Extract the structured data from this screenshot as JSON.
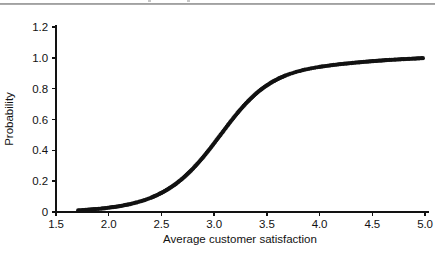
{
  "figure": {
    "background_color": "#ffffff",
    "ink_color": "#121212",
    "rule_color": "#8e8e8e"
  },
  "chart_data": {
    "type": "scatter",
    "title": "",
    "xlabel": "Average customer satisfaction",
    "ylabel": "Probability",
    "xlim": [
      1.5,
      5.0
    ],
    "ylim": [
      0.0,
      1.2
    ],
    "xticks": [
      "1.5",
      "2.0",
      "2.5",
      "3.0",
      "3.5",
      "4.0",
      "4.5",
      "5.0"
    ],
    "xtick_values": [
      1.5,
      2.0,
      2.5,
      3.0,
      3.5,
      4.0,
      4.5,
      5.0
    ],
    "yticks": [
      "0",
      "0.2",
      "0.4",
      "0.6",
      "0.8",
      "1.0",
      "1.2"
    ],
    "ytick_values": [
      0,
      0.2,
      0.4,
      0.6,
      0.8,
      1.0,
      1.2
    ],
    "grid": false,
    "legend": false,
    "marker": "filled-circle",
    "marker_color": "#121212",
    "marker_size_px": 4.2,
    "series": [
      {
        "name": "Predicted probability",
        "x": [
          1.71,
          1.86,
          1.93,
          1.97,
          1.99,
          2.02,
          2.06,
          2.09,
          2.12,
          2.15,
          2.19,
          2.22,
          2.24,
          2.27,
          2.29,
          2.31,
          2.34,
          2.36,
          2.38,
          2.4,
          2.42,
          2.44,
          2.46,
          2.48,
          2.5,
          2.52,
          2.54,
          2.56,
          2.58,
          2.6,
          2.62,
          2.64,
          2.66,
          2.68,
          2.7,
          2.72,
          2.74,
          2.76,
          2.78,
          2.8,
          2.82,
          2.84,
          2.86,
          2.88,
          2.9,
          2.92,
          2.94,
          2.96,
          2.98,
          3.0,
          3.02,
          3.04,
          3.06,
          3.08,
          3.1,
          3.12,
          3.14,
          3.16,
          3.18,
          3.2,
          3.22,
          3.24,
          3.26,
          3.28,
          3.3,
          3.32,
          3.34,
          3.36,
          3.38,
          3.4,
          3.42,
          3.44,
          3.46,
          3.48,
          3.5,
          3.52,
          3.54,
          3.56,
          3.58,
          3.6,
          3.62,
          3.64,
          3.66,
          3.68,
          3.7,
          3.72,
          3.74,
          3.76,
          3.78,
          3.8,
          3.82,
          3.84,
          3.86,
          3.88,
          3.9,
          3.92,
          3.94,
          3.96,
          3.98,
          4.0,
          4.03,
          4.06,
          4.09,
          4.12,
          4.15,
          4.18,
          4.21,
          4.24,
          4.27,
          4.3,
          4.34,
          4.38,
          4.42,
          4.46,
          4.5,
          4.55,
          4.6,
          4.65,
          4.71,
          4.78,
          4.84,
          4.9,
          4.95,
          4.98
        ],
        "y": [
          0.01,
          0.018,
          0.022,
          0.025,
          0.027,
          0.03,
          0.033,
          0.036,
          0.04,
          0.044,
          0.049,
          0.054,
          0.058,
          0.063,
          0.067,
          0.071,
          0.077,
          0.082,
          0.087,
          0.092,
          0.098,
          0.104,
          0.11,
          0.117,
          0.124,
          0.131,
          0.139,
          0.147,
          0.156,
          0.165,
          0.174,
          0.184,
          0.195,
          0.206,
          0.217,
          0.229,
          0.242,
          0.255,
          0.268,
          0.282,
          0.297,
          0.312,
          0.327,
          0.343,
          0.359,
          0.376,
          0.393,
          0.41,
          0.428,
          0.446,
          0.464,
          0.482,
          0.5,
          0.518,
          0.536,
          0.554,
          0.572,
          0.59,
          0.607,
          0.624,
          0.641,
          0.657,
          0.673,
          0.688,
          0.703,
          0.717,
          0.731,
          0.744,
          0.757,
          0.769,
          0.781,
          0.792,
          0.802,
          0.812,
          0.821,
          0.83,
          0.839,
          0.847,
          0.854,
          0.861,
          0.868,
          0.874,
          0.88,
          0.886,
          0.891,
          0.896,
          0.9,
          0.905,
          0.909,
          0.913,
          0.916,
          0.92,
          0.923,
          0.926,
          0.929,
          0.932,
          0.934,
          0.937,
          0.939,
          0.941,
          0.944,
          0.947,
          0.95,
          0.953,
          0.955,
          0.958,
          0.96,
          0.962,
          0.964,
          0.966,
          0.969,
          0.971,
          0.974,
          0.976,
          0.978,
          0.981,
          0.983,
          0.986,
          0.988,
          0.991,
          0.993,
          0.995,
          0.997,
          0.998
        ]
      }
    ]
  }
}
